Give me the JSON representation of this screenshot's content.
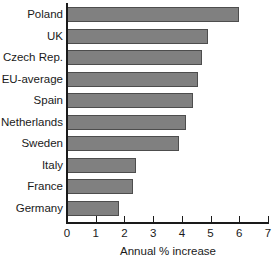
{
  "chart_data": {
    "type": "bar",
    "orientation": "horizontal",
    "title": "",
    "subtitle": "",
    "xlabel": "Annual % increase",
    "ylabel": "",
    "xlim": [
      0,
      7
    ],
    "xticks": [
      "0",
      "1",
      "2",
      "3",
      "4",
      "5",
      "6",
      "7"
    ],
    "grid": false,
    "legend": false,
    "categories": [
      "Poland",
      "UK",
      "Czech Rep.",
      "EU-average",
      "Spain",
      "Netherlands",
      "Sweden",
      "Italy",
      "France",
      "Germany"
    ],
    "values": [
      6.0,
      4.9,
      4.7,
      4.55,
      4.4,
      4.15,
      3.9,
      2.4,
      2.3,
      1.8
    ],
    "bars": [
      {
        "label": "Poland",
        "value": 6.0
      },
      {
        "label": "UK",
        "value": 4.9
      },
      {
        "label": "Czech Rep.",
        "value": 4.7
      },
      {
        "label": "EU-average",
        "value": 4.55
      },
      {
        "label": "Spain",
        "value": 4.4
      },
      {
        "label": "Netherlands",
        "value": 4.15
      },
      {
        "label": "Sweden",
        "value": 3.9
      },
      {
        "label": "Italy",
        "value": 2.4
      },
      {
        "label": "France",
        "value": 2.3
      },
      {
        "label": "Germany",
        "value": 1.8
      }
    ],
    "colors": {
      "bar_fill": "#808080",
      "bar_border": "#4d4d4d",
      "axis": "#1a1a1a",
      "text": "#1a1a1a",
      "background": "#ffffff"
    }
  }
}
